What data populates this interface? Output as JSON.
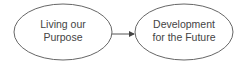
{
  "diagram": {
    "nodes": [
      {
        "id": "living",
        "line1": "Living our",
        "line2": "Purpose"
      },
      {
        "id": "development",
        "line1": "Development",
        "line2": "for the Future"
      }
    ],
    "edges": [
      {
        "from": "living",
        "to": "development"
      }
    ],
    "colors": {
      "stroke": "#555555",
      "text": "#444444",
      "background": "#ffffff"
    }
  }
}
